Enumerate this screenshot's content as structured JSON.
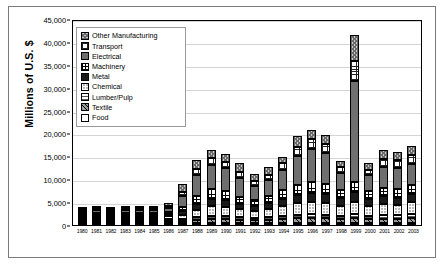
{
  "chart": {
    "type": "bar",
    "title": "",
    "ylabel": "Millions of U.S. $"
  },
  "axis": {
    "y_ticks": [
      "0",
      "5,000",
      "10,000",
      "15,000",
      "20,000",
      "25,000",
      "30,000",
      "35,000",
      "40,000",
      "45,000"
    ]
  },
  "legend": {
    "items": [
      {
        "label": "Other Manufacturing",
        "pattern": "p-other"
      },
      {
        "label": "Transport",
        "pattern": "p-transport"
      },
      {
        "label": "Electrical",
        "pattern": "p-electrical"
      },
      {
        "label": "Machinery",
        "pattern": "p-machinery"
      },
      {
        "label": "Metal",
        "pattern": "p-metal"
      },
      {
        "label": "Chemical",
        "pattern": "p-chemical"
      },
      {
        "label": "Lumber/Pulp",
        "pattern": "p-lumber"
      },
      {
        "label": "Textile",
        "pattern": "p-textile"
      },
      {
        "label": "Food",
        "pattern": "p-food"
      }
    ]
  },
  "chart_data": {
    "type": "bar",
    "stacked": true,
    "title": "",
    "xlabel": "",
    "ylabel": "Millions of U.S. $",
    "ylim": [
      0,
      45000
    ],
    "ytick_step": 5000,
    "grid": true,
    "legend_position": "inside-top-left",
    "categories": [
      "1980",
      "1981",
      "1982",
      "1983",
      "1984",
      "1985",
      "1986",
      "1987",
      "1988",
      "1989",
      "1990",
      "1991",
      "1992",
      "1993",
      "1994",
      "1995",
      "1996",
      "1997",
      "1998",
      "1999",
      "2000",
      "2001",
      "2002",
      "2003"
    ],
    "series": [
      {
        "name": "Food",
        "pattern": "p-food",
        "values": [
          60,
          80,
          70,
          90,
          90,
          80,
          150,
          200,
          250,
          300,
          280,
          260,
          240,
          260,
          300,
          350,
          380,
          360,
          330,
          400,
          380,
          420,
          420,
          480
        ]
      },
      {
        "name": "Textile",
        "pattern": "p-textile",
        "values": [
          120,
          160,
          140,
          180,
          180,
          160,
          300,
          500,
          700,
          850,
          800,
          700,
          650,
          700,
          850,
          1000,
          1100,
          1050,
          900,
          1100,
          850,
          950,
          900,
          1000
        ]
      },
      {
        "name": "Lumber/Pulp",
        "pattern": "p-lumber",
        "values": [
          100,
          140,
          120,
          150,
          150,
          140,
          250,
          400,
          600,
          700,
          650,
          600,
          550,
          600,
          700,
          800,
          850,
          800,
          700,
          900,
          700,
          800,
          780,
          850
        ]
      },
      {
        "name": "Chemical",
        "pattern": "p-chemical",
        "values": [
          280,
          380,
          330,
          420,
          420,
          380,
          600,
          900,
          1600,
          2100,
          2000,
          1700,
          1500,
          1700,
          2100,
          2500,
          2700,
          2500,
          2200,
          2700,
          2200,
          2400,
          2300,
          2600
        ]
      },
      {
        "name": "Metal",
        "pattern": "p-metal",
        "values": [
          180,
          240,
          210,
          270,
          270,
          240,
          400,
          700,
          1300,
          1600,
          1500,
          1200,
          1100,
          1300,
          1600,
          1900,
          2000,
          1900,
          1600,
          2000,
          1500,
          1700,
          1600,
          1800
        ]
      },
      {
        "name": "Machinery",
        "pattern": "p-machinery",
        "values": [
          200,
          270,
          240,
          300,
          300,
          270,
          450,
          900,
          1700,
          2100,
          2000,
          1500,
          1300,
          1500,
          1900,
          2200,
          2400,
          2200,
          1800,
          2300,
          1700,
          1900,
          1800,
          2100
        ]
      },
      {
        "name": "Electrical",
        "pattern": "p-electrical",
        "values": [
          400,
          550,
          480,
          620,
          620,
          560,
          1000,
          2500,
          4500,
          5300,
          5000,
          4200,
          3000,
          3600,
          4500,
          6200,
          7200,
          6800,
          3800,
          22000,
          3500,
          4600,
          4700,
          4600
        ]
      },
      {
        "name": "Transport",
        "pattern": "p-transport",
        "values": [
          120,
          160,
          140,
          180,
          180,
          160,
          300,
          900,
          1400,
          1600,
          1500,
          1300,
          1100,
          1200,
          1500,
          2000,
          2200,
          2100,
          1300,
          4500,
          1200,
          1600,
          1600,
          1800
        ]
      },
      {
        "name": "Other Manufacturing",
        "pattern": "p-other",
        "values": [
          140,
          220,
          170,
          290,
          290,
          310,
          550,
          1700,
          1950,
          1650,
          1670,
          1940,
          1460,
          1640,
          1250,
          2450,
          1850,
          1790,
          1270,
          5600,
          1570,
          1930,
          1800,
          1970
        ]
      }
    ],
    "totals": [
      1600,
      2200,
      1900,
      2500,
      2500,
      2300,
      4000,
      8700,
      14000,
      16200,
      15400,
      13400,
      10900,
      12500,
      14700,
      19400,
      20680,
      19500,
      13900,
      41500,
      13600,
      16300,
      15900,
      17200
    ]
  }
}
